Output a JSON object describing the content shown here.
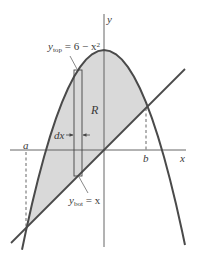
{
  "figure": {
    "axes": {
      "x_label": "x",
      "y_label": "y"
    },
    "curves": {
      "top": {
        "label_var": "y",
        "label_sub": "top",
        "label_eq": " = 6 − x",
        "label_sup": "2"
      },
      "bottom": {
        "label_var": "y",
        "label_sub": "bot",
        "label_eq": " = x"
      }
    },
    "region_label": "R",
    "strip_width_label": "dx",
    "bounds": {
      "a": "a",
      "b": "b"
    },
    "colors": {
      "shade": "#d9d9d9",
      "curve": "#4a4a4a",
      "axis": "#555555"
    }
  }
}
